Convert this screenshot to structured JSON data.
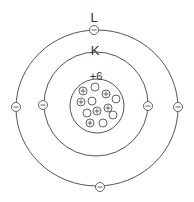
{
  "diagram": {
    "shells": [
      {
        "label": "L",
        "electrons": 4
      },
      {
        "label": "K",
        "electrons": 2
      }
    ],
    "nucleus": {
      "charge_label": "+6",
      "protons": 6,
      "neutrons": 6
    },
    "symbols": {
      "electron": "−",
      "proton": "+"
    },
    "colors": {
      "stroke": "#555555",
      "text": "#333333",
      "background": "#ffffff"
    }
  }
}
